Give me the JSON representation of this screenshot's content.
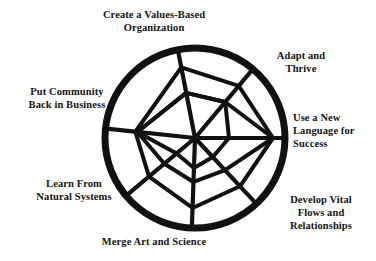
{
  "figure": {
    "type": "spiderweb-wheel-diagram",
    "title": "",
    "shape": "circle",
    "spoke_count": 7,
    "colors": {
      "ink": "#141414",
      "background": "#ffffff",
      "rim": "#111111",
      "web": "#111111"
    },
    "geometry": {
      "center_x": 195,
      "center_y": 138,
      "radius": 90,
      "rim_stroke_width": 7,
      "web_stroke_width": 4.2
    },
    "labels": [
      {
        "id": "values",
        "text": "Create a Values-Based\nOrganization",
        "align": "center",
        "angle_deg": -101
      },
      {
        "id": "adapt",
        "text": "Adapt and\nThrive",
        "align": "center",
        "angle_deg": -50
      },
      {
        "id": "language",
        "text": "Use a New\nLanguage for\nSuccess",
        "align": "left",
        "angle_deg": 0
      },
      {
        "id": "develop",
        "text": "Develop Vital\nFlows and\nRelationships",
        "align": "center",
        "angle_deg": 47
      },
      {
        "id": "merge",
        "text": "Merge Art and Science",
        "align": "center",
        "angle_deg": 92
      },
      {
        "id": "learn",
        "text": "Learn From\nNatural Systems",
        "align": "center",
        "angle_deg": 140
      },
      {
        "id": "community",
        "text": "Put Community\nBack in Business",
        "align": "center",
        "angle_deg": 186
      }
    ],
    "spokes": [
      {
        "id": "spoke-values",
        "angle_deg": -101,
        "label_id": "values"
      },
      {
        "id": "spoke-adapt",
        "angle_deg": -50,
        "label_id": "adapt"
      },
      {
        "id": "spoke-language",
        "angle_deg": 0,
        "label_id": "language"
      },
      {
        "id": "spoke-develop",
        "angle_deg": 47,
        "label_id": "develop"
      },
      {
        "id": "spoke-merge",
        "angle_deg": 92,
        "label_id": "merge"
      },
      {
        "id": "spoke-learn",
        "angle_deg": 140,
        "label_id": "learn"
      },
      {
        "id": "spoke-community",
        "angle_deg": 186,
        "label_id": "community"
      }
    ],
    "web_rings": [
      {
        "id": "ring-outer",
        "radii_by_spoke": [
          72,
          68,
          78,
          66,
          70,
          60,
          60
        ]
      },
      {
        "id": "ring-middle",
        "radii_by_spoke": [
          46,
          47,
          78,
          44,
          44,
          40,
          58
        ]
      },
      {
        "id": "ring-inner",
        "radii_by_spoke": [
          46,
          47,
          34,
          26,
          30,
          24,
          58
        ]
      }
    ]
  }
}
